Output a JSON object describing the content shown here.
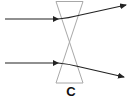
{
  "diagram": {
    "type": "optics-ray-diagram",
    "lens": {
      "shape": "hourglass",
      "stroke_color": "#a0a0a0"
    },
    "rays": [
      {
        "name": "upper-ray",
        "direction": "bends upward after lens"
      },
      {
        "name": "lower-ray",
        "direction": "bends downward after lens"
      }
    ],
    "ray_color": "#222222",
    "label": "C"
  }
}
